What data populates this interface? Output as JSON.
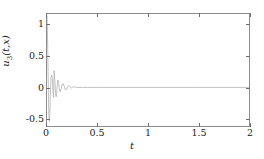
{
  "chart_data": {
    "type": "line",
    "title": "",
    "xlabel": "t",
    "ylabel": "u₃(t,x)",
    "ylabel_base": "u",
    "ylabel_sub": "3",
    "ylabel_rest": "(t,x)",
    "xlim": [
      0,
      2
    ],
    "ylim": [
      -0.62,
      1.18
    ],
    "xticks": [
      0,
      0.5,
      1,
      1.5,
      2
    ],
    "xticklabels": [
      "0",
      "0.5",
      "1",
      "1.5",
      "2"
    ],
    "yticks": [
      1,
      0.5,
      0,
      -0.5
    ],
    "yticklabels": [
      "1",
      "0.5",
      "0",
      "-0.5"
    ],
    "grid": false,
    "legend": null,
    "series": [
      {
        "name": "u3",
        "color": "#b9b9b9",
        "linewidth": 0.9,
        "description": "Strongly damped high-frequency oscillation decaying to zero",
        "x": [
          0,
          0.004,
          0.008,
          0.012,
          0.016,
          0.02,
          0.024,
          0.028,
          0.032,
          0.036,
          0.04,
          0.045,
          0.05,
          0.055,
          0.06,
          0.065,
          0.07,
          0.075,
          0.08,
          0.085,
          0.09,
          0.095,
          0.1,
          0.105,
          0.11,
          0.115,
          0.12,
          0.13,
          0.14,
          0.15,
          0.16,
          0.17,
          0.18,
          0.19,
          0.2,
          0.21,
          0.22,
          0.23,
          0.24,
          0.26,
          0.28,
          0.3,
          0.35,
          0.4,
          0.5,
          0.75,
          1.0,
          1.25,
          1.5,
          1.75,
          2.0
        ],
        "y": [
          1.15,
          0.92,
          0.55,
          0.12,
          -0.28,
          -0.52,
          -0.55,
          -0.42,
          -0.2,
          0.02,
          0.14,
          0.2,
          0.17,
          0.06,
          -0.08,
          -0.16,
          0.27,
          0.2,
          0.04,
          -0.1,
          -0.15,
          -0.1,
          0.0,
          0.09,
          0.12,
          0.08,
          0.0,
          -0.07,
          -0.02,
          0.05,
          0.06,
          0.02,
          -0.03,
          -0.04,
          -0.01,
          0.02,
          0.03,
          0.01,
          -0.01,
          0.01,
          0.005,
          0.0,
          0.0,
          0.0,
          0.0,
          0.0,
          0.0,
          0.0,
          0.0,
          0.0,
          0.0
        ]
      }
    ]
  },
  "axis_frame": {
    "border_color": "#8d8d8d",
    "background": "#ffffff"
  }
}
